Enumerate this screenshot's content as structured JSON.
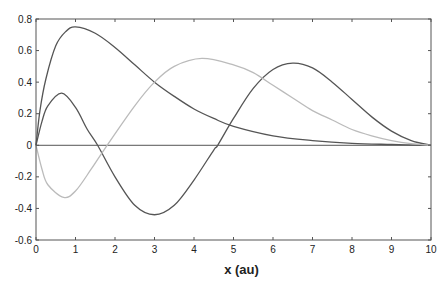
{
  "chart_data": {
    "type": "line",
    "title": "",
    "xlabel": "x (au)",
    "ylabel": "",
    "xlim": [
      0,
      10
    ],
    "ylim": [
      -0.6,
      0.8
    ],
    "xticks": [
      0,
      1,
      2,
      3,
      4,
      5,
      6,
      7,
      8,
      9,
      10
    ],
    "xtick_labels": [
      "0",
      "1",
      "2",
      "3",
      "4",
      "5",
      "6",
      "7",
      "8",
      "9",
      "10"
    ],
    "yticks": [
      0.8,
      0.6,
      0.4,
      0.2,
      0,
      -0.2,
      -0.4,
      -0.6
    ],
    "ytick_labels": [
      "0.8",
      "0.6",
      "0.4",
      "0.2",
      "0",
      "-0.2",
      "-0.4",
      "-0.6"
    ],
    "grid": false,
    "legend": null,
    "zero_line": true,
    "series": [
      {
        "name": "curve-1",
        "color": "#555555",
        "x": [
          0,
          0.1,
          0.25,
          0.5,
          0.75,
          1,
          1.5,
          2,
          2.5,
          3,
          3.5,
          4,
          4.5,
          5,
          6,
          7,
          8,
          9,
          10
        ],
        "values": [
          0,
          0.22,
          0.42,
          0.63,
          0.72,
          0.75,
          0.71,
          0.62,
          0.51,
          0.4,
          0.31,
          0.23,
          0.17,
          0.12,
          0.06,
          0.03,
          0.012,
          0.005,
          0
        ]
      },
      {
        "name": "curve-2",
        "color": "#555555",
        "x": [
          0,
          0.15,
          0.3,
          0.65,
          1,
          1.3,
          1.56,
          2,
          2.5,
          3,
          3.5,
          4,
          4.5,
          4.6,
          5,
          5.5,
          6,
          6.5,
          7,
          7.5,
          8,
          8.5,
          9,
          9.5,
          10
        ],
        "values": [
          0,
          0.15,
          0.25,
          0.33,
          0.24,
          0.1,
          0,
          -0.2,
          -0.38,
          -0.44,
          -0.38,
          -0.22,
          -0.03,
          0,
          0.17,
          0.36,
          0.48,
          0.52,
          0.49,
          0.4,
          0.29,
          0.18,
          0.09,
          0.03,
          0
        ]
      },
      {
        "name": "curve-3",
        "color": "#bbbbbb",
        "x": [
          0,
          0.15,
          0.3,
          0.7,
          1,
          1.4,
          1.8,
          2.5,
          3,
          3.5,
          4.2,
          5,
          5.5,
          6,
          6.5,
          7,
          7.5,
          8,
          8.5,
          9,
          9.5,
          10
        ],
        "values": [
          0,
          -0.15,
          -0.25,
          -0.33,
          -0.29,
          -0.15,
          0,
          0.25,
          0.4,
          0.5,
          0.55,
          0.51,
          0.46,
          0.38,
          0.3,
          0.22,
          0.16,
          0.1,
          0.06,
          0.03,
          0.01,
          0
        ]
      }
    ]
  }
}
